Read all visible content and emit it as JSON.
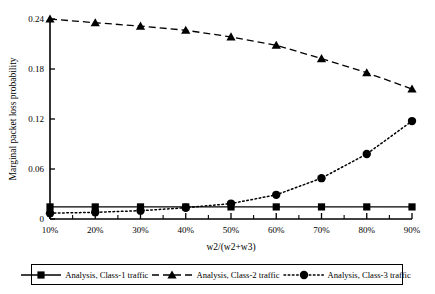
{
  "chart_data": {
    "type": "line",
    "title": "",
    "xlabel": "w2/(w2+w3)",
    "ylabel": "Marginal packet loss probability",
    "categories": [
      "10%",
      "20%",
      "30%",
      "40%",
      "50%",
      "60%",
      "70%",
      "80%",
      "90%"
    ],
    "x": [
      10,
      20,
      30,
      40,
      50,
      60,
      70,
      80,
      90
    ],
    "xlim": [
      10,
      90
    ],
    "ylim": [
      0,
      0.24
    ],
    "yticks": [
      0,
      0.06,
      0.12,
      0.18,
      0.24
    ],
    "ytick_labels": [
      "0",
      "0.06",
      "0.12",
      "0.18",
      "0.24"
    ],
    "xtick_labels": [
      "10%",
      "20%",
      "30%",
      "40%",
      "50%",
      "60%",
      "70%",
      "80%",
      "90%"
    ],
    "grid": false,
    "legend_position": "bottom",
    "series": [
      {
        "name": "Analysis, Class-1 traffic",
        "marker": "square",
        "linestyle": "solid",
        "color": "#000000",
        "values": [
          0.0145,
          0.0145,
          0.0145,
          0.0145,
          0.0145,
          0.0145,
          0.0145,
          0.0145,
          0.0145
        ]
      },
      {
        "name": "Analysis, Class-2 traffic",
        "marker": "triangle",
        "linestyle": "dashed",
        "color": "#000000",
        "values": [
          0.24,
          0.2355,
          0.2315,
          0.2265,
          0.2185,
          0.2085,
          0.1925,
          0.1755,
          0.156
        ]
      },
      {
        "name": "Analysis, Class-3 traffic",
        "marker": "circle",
        "linestyle": "dotted",
        "color": "#000000",
        "values": [
          0.007,
          0.008,
          0.01,
          0.0135,
          0.0185,
          0.029,
          0.049,
          0.078,
          0.1175
        ]
      }
    ]
  },
  "axes": {
    "y_title": "Marginal packet loss probability",
    "x_title": "w2/(w2+w3)",
    "y_ticks": [
      "0.24",
      "0.18",
      "0.12",
      "0.06",
      "0"
    ],
    "x_ticks": [
      "10%",
      "20%",
      "30%",
      "40%",
      "50%",
      "60%",
      "70%",
      "80%",
      "90%"
    ]
  },
  "legend": {
    "entries": [
      {
        "label": "Analysis, Class-1 traffic",
        "marker": "square",
        "linestyle": "solid"
      },
      {
        "label": "Analysis, Class-2 traffic",
        "marker": "triangle",
        "linestyle": "dashed"
      },
      {
        "label": "Analysis, Class-3 traffic",
        "marker": "circle",
        "linestyle": "dotted"
      }
    ]
  }
}
